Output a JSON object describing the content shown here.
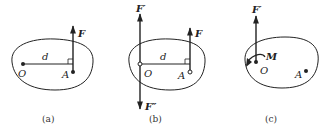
{
  "panels": [
    {
      "caption": "(a)",
      "labels": {
        "O": "O",
        "A": "A",
        "d": "d",
        "F": "F"
      }
    },
    {
      "caption": "(b)",
      "labels": {
        "O": "O",
        "A": "A",
        "d": "d",
        "F": "F",
        "F_prime": "F′",
        "F_double_prime": "F″"
      }
    },
    {
      "caption": "(c)",
      "labels": {
        "O": "O",
        "A": "A",
        "F_prime": "F′",
        "M": "M"
      }
    }
  ],
  "colors": {
    "stroke": "#222222",
    "background": "#ffffff"
  }
}
